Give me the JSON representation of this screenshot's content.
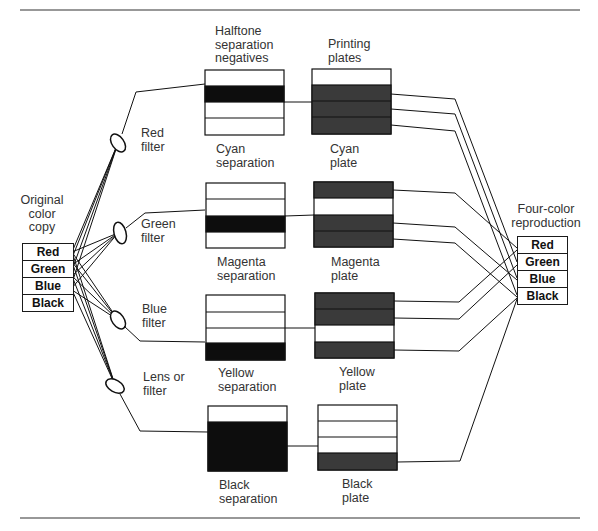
{
  "diagram": {
    "column_headers": {
      "negatives": "Halftone\nseparation\nnegatives",
      "plates": "Printing\nplates"
    },
    "original": {
      "label": "Original\ncolor\ncopy",
      "colors": [
        "Red",
        "Green",
        "Blue",
        "Black"
      ]
    },
    "reproduction": {
      "label": "Four-color\nreproduction",
      "colors": [
        "Red",
        "Green",
        "Blue",
        "Black"
      ]
    },
    "filters": [
      {
        "label": "Red\nfilter"
      },
      {
        "label": "Green\nfilter"
      },
      {
        "label": "Blue\nfilter"
      },
      {
        "label": "Lens or\nfilter"
      }
    ],
    "separations": [
      {
        "label": "Cyan\nseparation"
      },
      {
        "label": "Magenta\nseparation"
      },
      {
        "label": "Yellow\nseparation"
      },
      {
        "label": "Black\nseparation"
      }
    ],
    "plates": [
      {
        "label": "Cyan\nplate"
      },
      {
        "label": "Magenta\nplate"
      },
      {
        "label": "Yellow\nplate"
      },
      {
        "label": "Black\nplate"
      }
    ],
    "colors": {
      "line": "#1a1a1a",
      "negative_fill": "#0d0d0d",
      "plate_fill": "#3a3a3a"
    }
  }
}
